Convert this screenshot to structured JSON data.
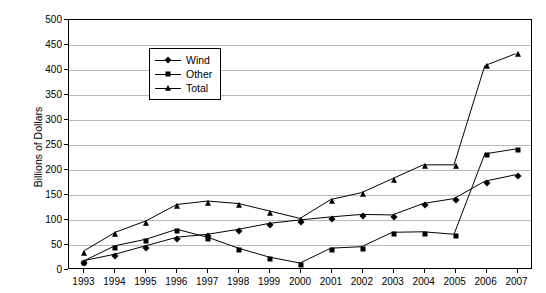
{
  "chart_data": {
    "type": "line",
    "title": "",
    "xlabel": "",
    "ylabel": "Billions of Dollars",
    "categories": [
      "1993",
      "1994",
      "1995",
      "1996",
      "1997",
      "1998",
      "1999",
      "2000",
      "2001",
      "2002",
      "2003",
      "2004",
      "2005",
      "2006",
      "2007"
    ],
    "ylim": [
      0,
      500
    ],
    "ytick_step": 50,
    "yticks": [
      "0",
      "50",
      "100",
      "150",
      "200",
      "250",
      "300",
      "350",
      "400",
      "450",
      "500"
    ],
    "grid": "horizontal",
    "legend_position": "top-left-inside",
    "series": [
      {
        "name": "Wind",
        "marker": "diamond",
        "color": "#000000",
        "values": [
          15,
          28,
          45,
          62,
          68,
          78,
          90,
          97,
          103,
          108,
          107,
          130,
          140,
          175,
          188
        ]
      },
      {
        "name": "Other",
        "marker": "square",
        "color": "#000000",
        "values": [
          15,
          45,
          58,
          78,
          62,
          40,
          22,
          10,
          40,
          43,
          72,
          73,
          68,
          230,
          240
        ]
      },
      {
        "name": "Total",
        "marker": "triangle",
        "color": "#000000",
        "values": [
          35,
          72,
          95,
          128,
          135,
          130,
          115,
          100,
          138,
          152,
          180,
          208,
          208,
          408,
          432
        ]
      }
    ]
  },
  "legend": {
    "items": [
      {
        "label": "Wind"
      },
      {
        "label": "Other"
      },
      {
        "label": "Total"
      }
    ]
  }
}
